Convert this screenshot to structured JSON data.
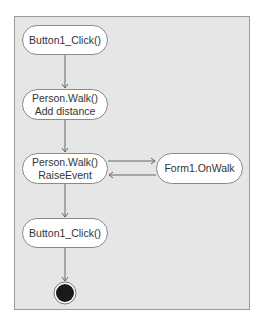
{
  "diagram": {
    "type": "activity-diagram",
    "nodes": [
      {
        "id": "n1",
        "lines": [
          "Button1_Click()"
        ]
      },
      {
        "id": "n2",
        "lines": [
          "Person.Walk()",
          "Add distance"
        ]
      },
      {
        "id": "n3",
        "lines": [
          "Person.Walk()",
          "RaiseEvent"
        ]
      },
      {
        "id": "n4",
        "lines": [
          "Form1.OnWalk"
        ]
      },
      {
        "id": "n5",
        "lines": [
          "Button1_Click()"
        ]
      },
      {
        "id": "end",
        "type": "final-state"
      }
    ],
    "edges": [
      {
        "from": "n1",
        "to": "n2"
      },
      {
        "from": "n2",
        "to": "n3"
      },
      {
        "from": "n3",
        "to": "n4"
      },
      {
        "from": "n4",
        "to": "n3"
      },
      {
        "from": "n3",
        "to": "n5"
      },
      {
        "from": "n5",
        "to": "end"
      }
    ]
  },
  "colors": {
    "panel_bg": "#e6e6e6",
    "panel_border": "#9a9a9a",
    "node_bg": "#ffffff",
    "node_border": "#8a8a8a",
    "edge": "#555555",
    "final_state": "#1a1a1a"
  }
}
